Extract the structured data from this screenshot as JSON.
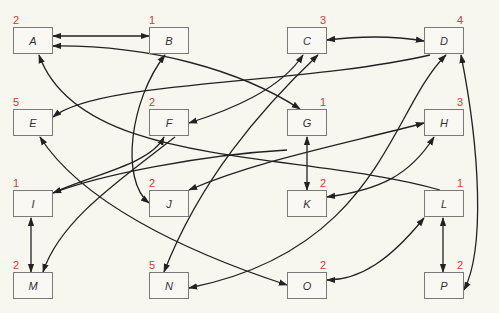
{
  "diagram": {
    "type": "directed-graph",
    "node_border_color": "#7a7a7a",
    "count_color": "#d23a3a",
    "edge_color": "#222222",
    "nodes": [
      {
        "id": "A",
        "label": "A",
        "count": "2"
      },
      {
        "id": "B",
        "label": "B",
        "count": "1"
      },
      {
        "id": "C",
        "label": "C",
        "count": "3"
      },
      {
        "id": "D",
        "label": "D",
        "count": "4"
      },
      {
        "id": "E",
        "label": "E",
        "count": "5"
      },
      {
        "id": "F",
        "label": "F",
        "count": "2"
      },
      {
        "id": "G",
        "label": "G",
        "count": "1"
      },
      {
        "id": "H",
        "label": "H",
        "count": "3"
      },
      {
        "id": "I",
        "label": "I",
        "count": "1"
      },
      {
        "id": "J",
        "label": "J",
        "count": "2"
      },
      {
        "id": "K",
        "label": "K",
        "count": "2"
      },
      {
        "id": "L",
        "label": "L",
        "count": "1"
      },
      {
        "id": "M",
        "label": "M",
        "count": "2"
      },
      {
        "id": "N",
        "label": "N",
        "count": "5"
      },
      {
        "id": "O",
        "label": "O",
        "count": "2"
      },
      {
        "id": "P",
        "label": "P",
        "count": "2"
      }
    ],
    "edges": [
      {
        "from": "A",
        "to": "B",
        "bidirectional": true
      },
      {
        "from": "G",
        "to": "A",
        "bidirectional": true
      },
      {
        "from": "L",
        "to": "A",
        "bidirectional": false
      },
      {
        "from": "C",
        "to": "D",
        "bidirectional": true
      },
      {
        "from": "D",
        "to": "E",
        "bidirectional": false
      },
      {
        "from": "C",
        "to": "F",
        "bidirectional": true
      },
      {
        "from": "N",
        "to": "C",
        "bidirectional": true
      },
      {
        "from": "B",
        "to": "J",
        "bidirectional": true
      },
      {
        "from": "E",
        "to": "O",
        "bidirectional": true
      },
      {
        "from": "I",
        "to": "F",
        "bidirectional": false
      },
      {
        "from": "G",
        "to": "I",
        "bidirectional": false
      },
      {
        "from": "F",
        "to": "M",
        "bidirectional": false
      },
      {
        "from": "J",
        "to": "H",
        "bidirectional": true
      },
      {
        "from": "G",
        "to": "K",
        "bidirectional": true
      },
      {
        "from": "H",
        "to": "K",
        "bidirectional": true
      },
      {
        "from": "D",
        "to": "N",
        "bidirectional": true
      },
      {
        "from": "I",
        "to": "M",
        "bidirectional": true
      },
      {
        "from": "L",
        "to": "O",
        "bidirectional": true
      },
      {
        "from": "L",
        "to": "P",
        "bidirectional": true
      },
      {
        "from": "D",
        "to": "P",
        "bidirectional": true
      }
    ]
  }
}
